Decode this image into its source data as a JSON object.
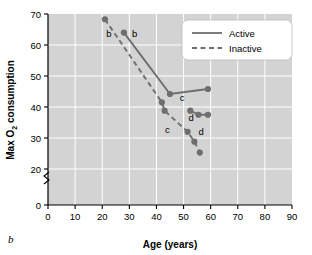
{
  "figure": {
    "letter": "b"
  },
  "chart_data": {
    "type": "line",
    "title": "",
    "xlabel": "Age (years)",
    "ylabel_parts": {
      "pre": "Max O",
      "sub": "2",
      "post": " consumption"
    },
    "ylabel": "Max O2 consumption",
    "xlim": [
      0,
      90
    ],
    "ylim": [
      0,
      70
    ],
    "y_axis_break": {
      "present": true,
      "between": [
        0,
        20
      ]
    },
    "xticks": [
      0,
      10,
      20,
      30,
      40,
      50,
      60,
      70,
      80,
      90
    ],
    "yticks": [
      0,
      20,
      30,
      40,
      50,
      60,
      70
    ],
    "grid": true,
    "grid_color": "#ffffff",
    "plot_bg": "#d3d3d3",
    "marker_color": "#6e6e6e",
    "line_color": "#6e6e6e",
    "legend": {
      "position": "top-right",
      "entries": [
        {
          "name": "Active",
          "style": "solid"
        },
        {
          "name": "Inactive",
          "style": "dashed"
        }
      ]
    },
    "series": [
      {
        "name": "Active",
        "style": "solid",
        "segments": [
          {
            "points": [
              [
                28,
                64.0
              ],
              [
                45,
                44.2
              ],
              [
                59,
                45.8
              ]
            ]
          },
          {
            "points": [
              [
                52.5,
                38.8
              ],
              [
                55.5,
                37.5
              ],
              [
                59,
                37.5
              ]
            ]
          }
        ]
      },
      {
        "name": "Inactive",
        "style": "dashed",
        "segments": [
          {
            "points": [
              [
                21,
                68.3
              ],
              [
                42,
                41.5
              ],
              [
                43,
                38.8
              ],
              [
                51.5,
                32.0
              ],
              [
                54,
                28.8
              ],
              [
                56,
                25.3
              ]
            ]
          }
        ]
      }
    ],
    "annotations": [
      {
        "text": "b",
        "x": 22.5,
        "y": 62.5
      },
      {
        "text": "b",
        "x": 32.0,
        "y": 62.5
      },
      {
        "text": "c",
        "x": 49.5,
        "y": 42.0
      },
      {
        "text": "c",
        "x": 44.0,
        "y": 31.5
      },
      {
        "text": "d",
        "x": 52.8,
        "y": 35.5
      },
      {
        "text": "d",
        "x": 56.5,
        "y": 31.0
      }
    ]
  }
}
